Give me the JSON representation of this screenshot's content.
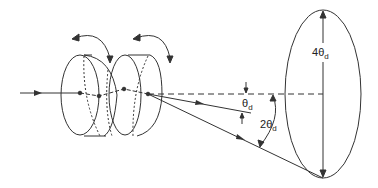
{
  "diagram": {
    "labels": {
      "theta_d": {
        "main": "θ",
        "sub": "d"
      },
      "two_theta_d": {
        "prefix": "2",
        "main": "θ",
        "sub": "d"
      },
      "four_theta_d": {
        "prefix": "4",
        "main": "θ",
        "sub": "d"
      }
    },
    "colors": {
      "line": "#333333",
      "background": "#ffffff"
    }
  }
}
